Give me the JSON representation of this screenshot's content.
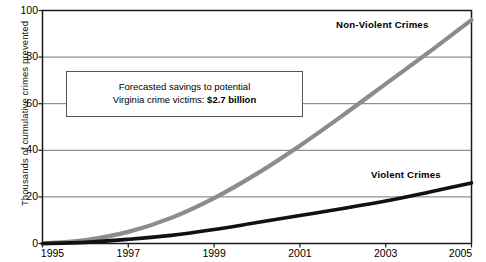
{
  "chart_data": {
    "type": "line",
    "title": "",
    "xlabel": "",
    "ylabel": "Thousands of cumulative crimes prevented",
    "xlim": [
      1995,
      2005
    ],
    "ylim": [
      0,
      100
    ],
    "grid": true,
    "legend_position": "inline-annotation",
    "x": [
      1995,
      1996,
      1997,
      1998,
      1999,
      2000,
      2001,
      2002,
      2003,
      2004,
      2005
    ],
    "series": [
      {
        "name": "Non-Violent Crimes",
        "color": "#8c8c8c",
        "values": [
          0,
          1.5,
          5,
          11,
          19.5,
          30,
          42,
          55,
          68.5,
          82,
          96
        ]
      },
      {
        "name": "Violent Crimes",
        "color": "#111111",
        "values": [
          0,
          0.5,
          1.8,
          3.5,
          6,
          9,
          12,
          15,
          18.2,
          22,
          26
        ]
      }
    ],
    "ytick_labels": [
      "0",
      "20",
      "40",
      "60",
      "80",
      "100"
    ],
    "ytick_values": [
      0,
      20,
      40,
      60,
      80,
      100
    ],
    "xtick_labels": [
      "1995",
      "1997",
      "1999",
      "2001",
      "2003",
      "2005"
    ],
    "xtick_values": [
      1995,
      1997,
      1999,
      2001,
      2003,
      2005
    ],
    "annotations": [
      {
        "name": "forecast-callout",
        "line1": "Forecasted savings to potential",
        "line2_prefix": "Virginia crime victims: ",
        "line2_strong": "$2.7 billion"
      }
    ]
  },
  "axis": {
    "y_title": "Thousands of cumulative crimes prevented",
    "y_ticks": [
      "0",
      "20",
      "40",
      "60",
      "80",
      "100"
    ],
    "x_ticks": [
      "1995",
      "1997",
      "1999",
      "2001",
      "2003",
      "2005"
    ]
  },
  "labels": {
    "nonviolent": "Non-Violent Crimes",
    "violent": "Violent Crimes"
  },
  "callout": {
    "line1": "Forecasted savings to potential",
    "line2_prefix": "Virginia crime victims: ",
    "line2_strong": "$2.7 billion"
  },
  "colors": {
    "nonviolent_line": "#8c8c8c",
    "violent_line": "#111111",
    "grid": "#666666",
    "frame": "#1a1a1a"
  }
}
